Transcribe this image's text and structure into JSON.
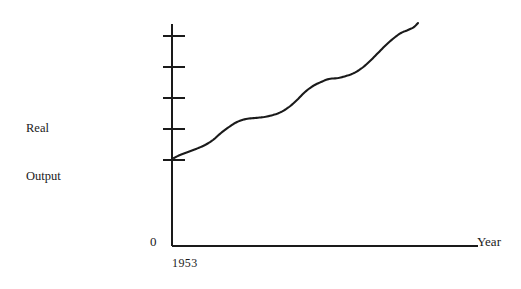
{
  "figure": {
    "background_color": "#ffffff",
    "ink_color": "#1a1a1a",
    "width": 521,
    "height": 289
  },
  "labels": {
    "y_axis_title_line1": "Real",
    "y_axis_title_line2": "Output",
    "origin": "0",
    "x_axis_start": "1953",
    "x_axis_title": "Year"
  },
  "chart_data": {
    "type": "line",
    "title": "",
    "xlabel": "Year",
    "ylabel": "Real Output",
    "grid": false,
    "legend": "none",
    "x_axis": {
      "label": "Year",
      "start_tick_label": "1953",
      "origin_label": "0",
      "ticks_labeled": [
        "1953"
      ],
      "arrow": false,
      "pixel_start": 172,
      "pixel_end": 478,
      "pixel_y": 246
    },
    "y_axis": {
      "label": "Real Output",
      "origin_label": "0",
      "tick_count": 5,
      "tick_labels": [
        "",
        "",
        "",
        "",
        ""
      ],
      "tick_pixel_y": [
        36,
        67,
        98,
        129,
        160
      ],
      "pixel_x": 172,
      "pixel_top": 24,
      "pixel_bottom": 246
    },
    "series": [
      {
        "name": "Real Output",
        "description": "Upward trending growth path with periodic flattenings (business-cycle pauses) rising from 1953 onward",
        "color": "#1a1a1a",
        "line_width": 2.1,
        "points_pixel": [
          [
            174,
            158
          ],
          [
            180,
            155
          ],
          [
            188,
            152
          ],
          [
            196,
            149
          ],
          [
            205,
            145
          ],
          [
            213,
            140
          ],
          [
            221,
            133
          ],
          [
            229,
            127
          ],
          [
            237,
            122
          ],
          [
            246,
            119
          ],
          [
            255,
            118
          ],
          [
            264,
            117
          ],
          [
            273,
            115
          ],
          [
            281,
            112
          ],
          [
            289,
            107
          ],
          [
            297,
            100
          ],
          [
            305,
            92
          ],
          [
            313,
            86
          ],
          [
            321,
            82
          ],
          [
            329,
            79
          ],
          [
            338,
            78
          ],
          [
            346,
            76
          ],
          [
            354,
            73
          ],
          [
            362,
            68
          ],
          [
            370,
            61
          ],
          [
            378,
            53
          ],
          [
            386,
            45
          ],
          [
            394,
            38
          ],
          [
            401,
            33
          ],
          [
            408,
            30
          ],
          [
            414,
            27
          ],
          [
            418,
            23
          ]
        ],
        "normalized_values": [
          0.4,
          0.41,
          0.42,
          0.44,
          0.46,
          0.48,
          0.51,
          0.54,
          0.56,
          0.57,
          0.58,
          0.58,
          0.59,
          0.6,
          0.63,
          0.66,
          0.69,
          0.72,
          0.74,
          0.75,
          0.76,
          0.77,
          0.78,
          0.8,
          0.83,
          0.87,
          0.91,
          0.94,
          0.96,
          0.97,
          0.99,
          1.0
        ]
      }
    ],
    "annotations": []
  }
}
